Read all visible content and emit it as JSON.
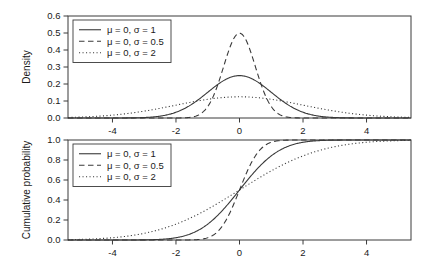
{
  "figure": {
    "background": "#ffffff",
    "line_color": "#3a3a3a",
    "axis_color": "#3a3a3a"
  },
  "chart_data": [
    {
      "type": "line",
      "panel": "top",
      "title": "",
      "xlabel": "",
      "ylabel": "Density",
      "xlim": [
        -5.4,
        5.4
      ],
      "ylim": [
        0.0,
        0.6
      ],
      "xticks": [
        -4,
        -2,
        0,
        2,
        4
      ],
      "xticklabels": [
        "-4",
        "-2",
        "0",
        "2",
        "4"
      ],
      "yticks": [
        0.0,
        0.1,
        0.2,
        0.3,
        0.4,
        0.5,
        0.6
      ],
      "yticklabels": [
        "0.0",
        "0.1",
        "0.2",
        "0.3",
        "0.4",
        "0.5",
        "0.6"
      ],
      "grid": false,
      "legend_position": "upper-left",
      "density_scale": 0.625,
      "series": [
        {
          "name": "μ = 0, σ = 1",
          "mu": 0,
          "sigma": 1,
          "style": "solid",
          "peak": 0.249
        },
        {
          "name": "μ = 0, σ = 0.5",
          "mu": 0,
          "sigma": 0.5,
          "style": "dashed",
          "peak": 0.499
        },
        {
          "name": "μ = 0, σ = 2",
          "mu": 0,
          "sigma": 2,
          "style": "dotted",
          "peak": 0.125
        }
      ]
    },
    {
      "type": "line",
      "panel": "bottom",
      "title": "",
      "xlabel": "",
      "ylabel": "Cumulative probability",
      "xlim": [
        -5.4,
        5.4
      ],
      "ylim": [
        0.0,
        1.0
      ],
      "xticks": [
        -4,
        -2,
        0,
        2,
        4
      ],
      "xticklabels": [
        "-4",
        "-2",
        "0",
        "2",
        "4"
      ],
      "yticks": [
        0.0,
        0.2,
        0.4,
        0.6,
        0.8,
        1.0
      ],
      "yticklabels": [
        "0.0",
        "0.2",
        "0.4",
        "0.6",
        "0.8",
        "1.0"
      ],
      "grid": false,
      "legend_position": "upper-left",
      "series": [
        {
          "name": "μ = 0, σ = 1",
          "mu": 0,
          "sigma": 1,
          "style": "solid"
        },
        {
          "name": "μ = 0, σ = 0.5",
          "mu": 0,
          "sigma": 0.5,
          "style": "dashed"
        },
        {
          "name": "μ = 0, σ = 2",
          "mu": 0,
          "sigma": 2,
          "style": "dotted"
        }
      ]
    }
  ]
}
